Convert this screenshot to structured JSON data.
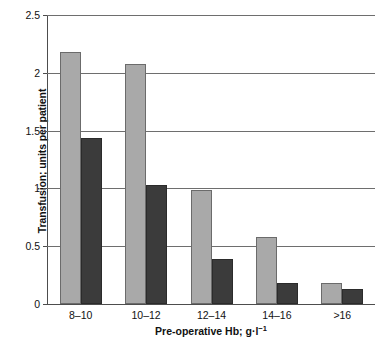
{
  "chart_data": {
    "type": "bar",
    "title": "",
    "xlabel": "Pre-operative Hb; g·l",
    "xlabel_exponent": "−1",
    "ylabel": "Transfusion; units per patient",
    "categories": [
      "8–10",
      "10–12",
      "12–14",
      "14–16",
      ">16"
    ],
    "series": [
      {
        "name": "light-gray-series",
        "color": "#a9a9a9",
        "values": [
          2.18,
          2.08,
          0.99,
          0.58,
          0.18
        ]
      },
      {
        "name": "dark-gray-series",
        "color": "#3b3b3b",
        "values": [
          1.44,
          1.03,
          0.39,
          0.18,
          0.13
        ]
      }
    ],
    "ylim": [
      0,
      2.5
    ],
    "yticks": [
      0,
      0.5,
      1,
      1.5,
      2,
      2.5
    ],
    "ytick_labels": [
      "0",
      "0.5",
      "1",
      "1.5",
      "2",
      "2.5"
    ],
    "grid": true,
    "grid_axis": "y",
    "legend": "none"
  }
}
